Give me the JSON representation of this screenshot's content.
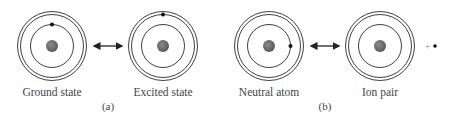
{
  "panels": [
    {
      "id": "a",
      "caption": "(a)",
      "left": {
        "label": "Ground state",
        "electron": "inner-orbit-top"
      },
      "right": {
        "label": "Excited state",
        "electron": "outer-orbit-top"
      },
      "connector": "double-headed-arrow"
    },
    {
      "id": "b",
      "caption": "(b)",
      "left": {
        "label": "Neutral atom",
        "electron": "inner-orbit-right"
      },
      "right": {
        "label": "Ion pair",
        "electron": "free-electron",
        "ion_symbol": "+"
      },
      "connector": "double-headed-arrow"
    }
  ],
  "colors": {
    "nucleus": "#6e6e6e",
    "orbit": "#2a2a2a",
    "electron": "#111111",
    "text": "#444444"
  }
}
